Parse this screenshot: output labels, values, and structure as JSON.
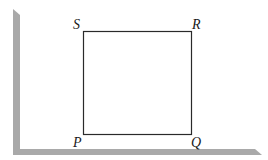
{
  "figure": {
    "shape": "square",
    "vertices": [
      {
        "name": "P",
        "position": "bottom-left"
      },
      {
        "name": "Q",
        "position": "bottom-right"
      },
      {
        "name": "R",
        "position": "top-right"
      },
      {
        "name": "S",
        "position": "top-left"
      }
    ],
    "labels": {
      "P": "P",
      "Q": "Q",
      "R": "R",
      "S": "S"
    }
  },
  "colors": {
    "background": "#ffffff",
    "card_shadow": "#a9a9a9",
    "line": "#2a2a2a"
  }
}
